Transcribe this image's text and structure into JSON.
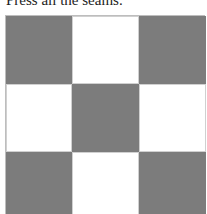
{
  "caption": "Press all the seams.",
  "quilt_block": {
    "rows": 3,
    "cols": 3,
    "pattern": [
      [
        "dark",
        "light",
        "dark"
      ],
      [
        "light",
        "dark",
        "light"
      ],
      [
        "dark",
        "light",
        "dark"
      ]
    ],
    "colors": {
      "dark": "#7c7c7c",
      "light": "#ffffff"
    }
  }
}
